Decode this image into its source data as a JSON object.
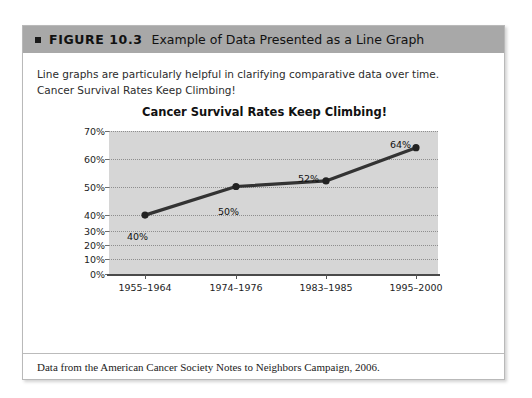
{
  "figure": {
    "bullet_icon": "square-bullet-icon",
    "number_label": "FIGURE 10.3",
    "title": "Example of Data Presented as a Line Graph",
    "intro_line1": "Line graphs are particularly helpful in clarifying comparative data over time.",
    "intro_line2": "Cancer Survival Rates Keep Climbing!",
    "source_note": "Data from the American Cancer Society Notes to Neighbors Campaign, 2006."
  },
  "chart_data": {
    "type": "line",
    "title": "Cancer Survival Rates Keep Climbing!",
    "xlabel": "",
    "ylabel": "",
    "categories": [
      "1955–1964",
      "1974–1976",
      "1983–1985",
      "1995–2000"
    ],
    "values": [
      40,
      50,
      52,
      64
    ],
    "point_labels": [
      "40%",
      "50%",
      "52%",
      "64%"
    ],
    "ytick_labels": [
      "70%",
      "60%",
      "50%",
      "40%",
      "30%",
      "20%",
      "10%",
      "0%"
    ],
    "ytick_values": [
      70,
      60,
      50,
      40,
      30,
      20,
      10,
      0
    ],
    "ylim": [
      0,
      70
    ],
    "grid": true,
    "legend": "none",
    "series": [
      {
        "name": "Cancer survival rate",
        "values": [
          40,
          50,
          52,
          64
        ]
      }
    ],
    "colors": {
      "line": "#333333",
      "marker": "#222222",
      "plot_background": "#d6d6d6",
      "gridline": "#8e8e8e",
      "header_bar": "#a8a8a8"
    }
  }
}
